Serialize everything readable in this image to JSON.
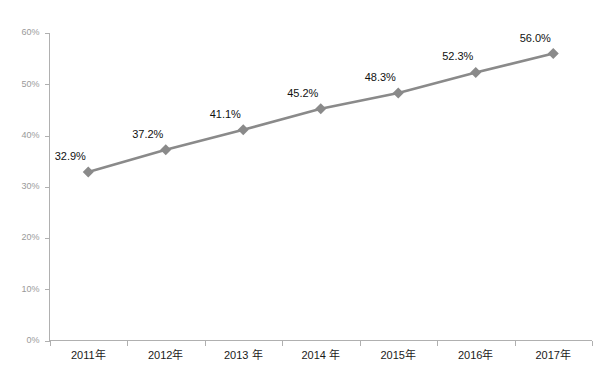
{
  "chart_data": {
    "type": "line",
    "title": "",
    "subtitle": "",
    "xlabel": "",
    "ylabel": "",
    "categories": [
      "2011年",
      "2012年",
      "2013 年",
      "2014 年",
      "2015年",
      "2016年",
      "2017年"
    ],
    "values": [
      32.9,
      37.2,
      41.1,
      45.2,
      48.3,
      52.3,
      56.0
    ],
    "point_labels": [
      "32.9%",
      "37.2%",
      "41.1%",
      "45.2%",
      "48.3%",
      "52.3%",
      "56.0%"
    ],
    "series": [
      {
        "name": "",
        "values": [
          32.9,
          37.2,
          41.1,
          45.2,
          48.3,
          52.3,
          56.0
        ]
      }
    ],
    "ylim": [
      0,
      60
    ],
    "ytick_values": [
      0,
      10,
      20,
      30,
      40,
      50,
      60
    ],
    "ytick_labels": [
      "0%",
      "10%",
      "20%",
      "30%",
      "40%",
      "50%",
      "60%"
    ],
    "grid": false,
    "legend": false,
    "legend_position": "none",
    "marker": "diamond",
    "line_color": "#8a8a8a",
    "marker_color": "#8a8a8a",
    "axis_color": "#b0b0b0",
    "label_color": "#111111",
    "ytick_color": "#9a9a9a"
  },
  "caption": {
    "text": ""
  }
}
